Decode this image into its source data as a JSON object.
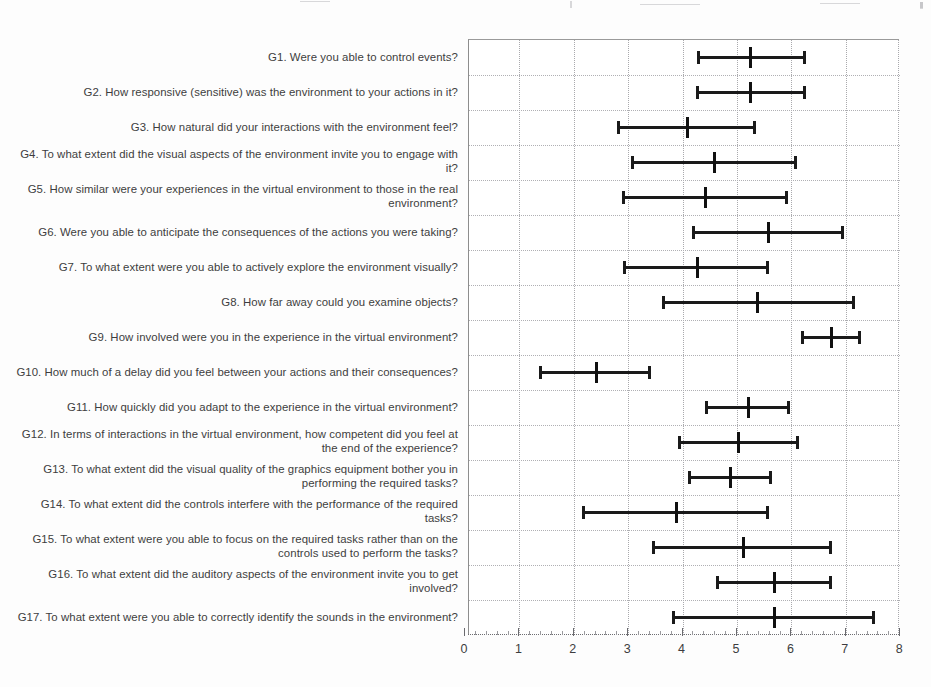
{
  "figure": {
    "kind": "error-bar-chart",
    "background_color": "#ffffff",
    "marker_color": "#1a1a1a",
    "grid_color": "#a9a9ad",
    "text_color": "#3d3d40"
  },
  "axis": {
    "tick_labels": [
      "0",
      "1",
      "2",
      "3",
      "4",
      "5",
      "6",
      "7",
      "8"
    ],
    "min": 0,
    "max": 8,
    "step": 1
  },
  "chart_data": {
    "type": "bar",
    "title": "",
    "subtitle": "",
    "xlabel": "",
    "ylabel": "",
    "xlim": [
      0,
      8
    ],
    "grid": true,
    "legend": "none",
    "orientation": "horizontal",
    "marker_style": "median with min-max whisker caps",
    "categories": [
      "G1. Were you able to control events?",
      "G2. How responsive (sensitive) was the environment to your actions in it?",
      "G3. How natural did your interactions with the environment feel?",
      "G4. To what extent did the visual aspects of the environment invite you to engage with it?",
      "G5. How similar were your experiences in the virtual environment to those in the real environment?",
      "G6. Were you able to anticipate the consequences of the actions you were taking?",
      "G7. To what extent were you able to actively explore the environment visually?",
      "G8. How far away could you examine objects?",
      "G9. How involved were you in the experience in the virtual environment?",
      "G10. How much of a delay did you feel between your actions and their consequences?",
      "G11. How quickly did you adapt to the experience in the virtual environment?",
      "G12. In terms of interactions in the virtual environment, how competent did you feel at the end of the experience?",
      "G13. To what extent did the visual quality of the graphics equipment bother you in performing the required tasks?",
      "G14. To what extent did the controls interfere with the performance of the required tasks?",
      "G15. To what extent were you able to focus on the required tasks rather than on the controls used to perform the tasks?",
      "G16. To what extent did the auditory aspects of the environment invite you to get involved?",
      "G17. To what extent were you able to correctly identify the sounds in the environment?"
    ],
    "series": [
      {
        "name": "lower",
        "values": [
          4.28,
          4.26,
          2.81,
          3.07,
          2.9,
          4.19,
          2.92,
          3.64,
          6.19,
          1.38,
          4.43,
          3.93,
          4.12,
          2.17,
          3.46,
          4.63,
          3.82
        ]
      },
      {
        "name": "median",
        "values": [
          5.24,
          5.24,
          4.08,
          4.58,
          4.41,
          5.57,
          4.26,
          5.37,
          6.73,
          2.41,
          5.2,
          5.02,
          4.87,
          3.88,
          5.11,
          5.68,
          5.68
        ]
      },
      {
        "name": "upper",
        "values": [
          6.25,
          6.25,
          5.33,
          6.09,
          5.92,
          6.95,
          5.57,
          7.15,
          7.26,
          3.4,
          5.96,
          6.12,
          5.63,
          5.57,
          6.73,
          6.73,
          7.52
        ]
      }
    ]
  }
}
